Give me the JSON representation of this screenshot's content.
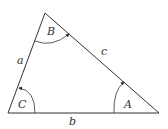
{
  "diagram": {
    "type": "triangle",
    "vertices": {
      "top": [
        45,
        13
      ],
      "bottom_left": [
        8,
        113
      ],
      "bottom_right": [
        159,
        113
      ]
    },
    "angle_labels": {
      "top": "B",
      "bottom_left": "C",
      "bottom_right": "A"
    },
    "side_labels": {
      "left": "a",
      "right": "c",
      "bottom": "b"
    },
    "colors": {
      "stroke": "#333333",
      "background": "#ffffff"
    }
  }
}
